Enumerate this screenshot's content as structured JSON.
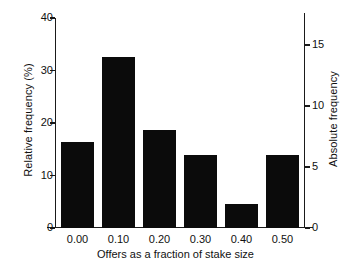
{
  "chart_data": {
    "type": "bar",
    "title": "",
    "subtitle": "",
    "xlabel": "Offers as a fraction of stake size",
    "ylabel": "Relative frequency (%)",
    "y2label": "Absolute frequency",
    "categories": [
      "0.00",
      "0.10",
      "0.20",
      "0.30",
      "0.40",
      "0.50"
    ],
    "x": [
      0.0,
      0.1,
      0.2,
      0.3,
      0.4,
      0.5
    ],
    "values": [
      16.3,
      32.5,
      18.6,
      13.9,
      4.6,
      13.9
    ],
    "series": [
      {
        "name": "Relative frequency (%)",
        "values": [
          16.3,
          32.5,
          18.6,
          13.9,
          4.6,
          13.9
        ]
      },
      {
        "name": "Absolute frequency",
        "values": [
          7,
          14,
          8,
          6,
          2,
          6
        ]
      }
    ],
    "ylim": [
      0,
      40
    ],
    "y2lim": [
      0,
      17.2
    ],
    "xlim": [
      -0.055,
      0.555
    ],
    "yticks": [
      0,
      10,
      20,
      30,
      40
    ],
    "ytick_labels": [
      "0",
      "10",
      "20",
      "30",
      "40"
    ],
    "y2ticks": [
      0,
      5,
      10,
      15
    ],
    "y2tick_labels": [
      "0",
      "5",
      "10",
      "15"
    ],
    "xtick_labels": [
      "0.00",
      "0.10",
      "0.20",
      "0.30",
      "0.40",
      "0.50"
    ],
    "grid": false,
    "legend": false,
    "legend_position": "none",
    "bar_color": "#0b0b0b",
    "axis_color": "#1a1a1a",
    "background": "#ffffff",
    "total_n": 43,
    "annotations": []
  }
}
